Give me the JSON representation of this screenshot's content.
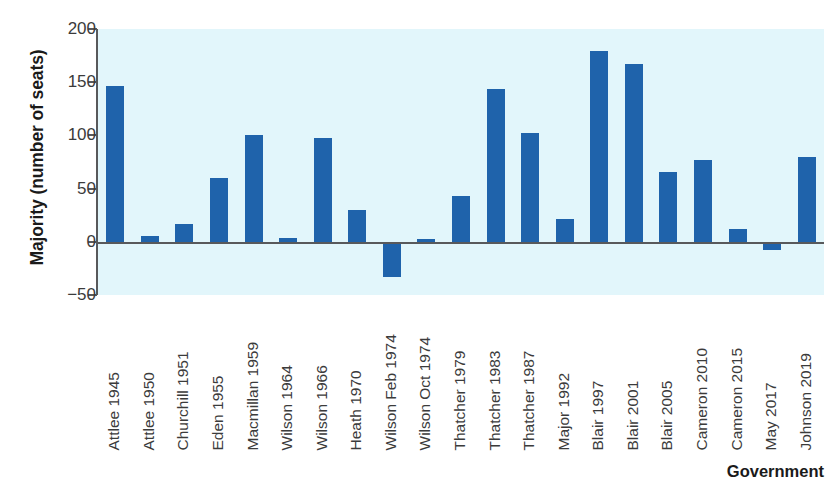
{
  "chart_data": {
    "type": "bar",
    "title": "",
    "xlabel": "Government",
    "ylabel": "Majority (number of seats)",
    "ylim": [
      -50,
      200
    ],
    "yticks": [
      200,
      150,
      100,
      50,
      0,
      -50
    ],
    "ytick_labels": [
      "200",
      "150",
      "100",
      "50",
      "0",
      "−50"
    ],
    "grid": false,
    "legend": false,
    "bar_color": "#1f63ab",
    "plot_background": "#e2f6fb",
    "axis_color": "#58595b",
    "categories": [
      "Attlee 1945",
      "Attlee 1950",
      "Churchill 1951",
      "Eden 1955",
      "Macmillan 1959",
      "Wilson 1964",
      "Wilson 1966",
      "Heath 1970",
      "Wilson Feb 1974",
      "Wilson Oct 1974",
      "Thatcher 1979",
      "Thatcher 1983",
      "Thatcher 1987",
      "Major 1992",
      "Blair 1997",
      "Blair 2001",
      "Blair 2005",
      "Cameron 2010",
      "Cameron 2015",
      "May 2017",
      "Johnson 2019"
    ],
    "values": [
      146,
      5,
      17,
      60,
      100,
      4,
      98,
      30,
      -33,
      3,
      43,
      144,
      102,
      21,
      179,
      167,
      66,
      77,
      12,
      -8,
      80
    ],
    "series": [
      {
        "name": "Majority (number of seats)",
        "values": [
          146,
          5,
          17,
          60,
          100,
          4,
          98,
          30,
          -33,
          3,
          43,
          144,
          102,
          21,
          179,
          167,
          66,
          77,
          12,
          -8,
          80
        ]
      }
    ]
  }
}
